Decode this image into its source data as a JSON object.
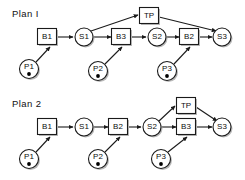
{
  "figure": {
    "type": "process-flow-diagram",
    "width": 245,
    "height": 180,
    "background_color": "#ffffff",
    "stroke_color": "#1a1a1a",
    "shadow_color": "#b9b9b9",
    "token_color": "#000000"
  },
  "plans": [
    {
      "id": "plan-1",
      "label": "Plan  I",
      "nodes": [
        {
          "id": "b1",
          "label": "B1",
          "shape": "square",
          "cx": 47,
          "cy": 37
        },
        {
          "id": "s1",
          "label": "S1",
          "shape": "circle",
          "cx": 84,
          "cy": 37
        },
        {
          "id": "tp",
          "label": "TP",
          "shape": "square",
          "cx": 149,
          "cy": 16
        },
        {
          "id": "b3",
          "label": "B3",
          "shape": "square",
          "cx": 121,
          "cy": 37
        },
        {
          "id": "s2",
          "label": "S2",
          "shape": "circle",
          "cx": 157,
          "cy": 37
        },
        {
          "id": "b2",
          "label": "B2",
          "shape": "square",
          "cx": 189,
          "cy": 37
        },
        {
          "id": "s3",
          "label": "S3",
          "shape": "circle",
          "cx": 222,
          "cy": 37
        },
        {
          "id": "p1",
          "label": "P1",
          "shape": "token-circle",
          "cx": 29,
          "cy": 69
        },
        {
          "id": "p2",
          "label": "P2",
          "shape": "token-circle",
          "cx": 98,
          "cy": 71
        },
        {
          "id": "p3",
          "label": "P3",
          "shape": "token-circle",
          "cx": 167,
          "cy": 71
        }
      ],
      "edges": [
        {
          "from": "b1",
          "to": "s1"
        },
        {
          "from": "s1",
          "to": "tp"
        },
        {
          "from": "s1",
          "to": "b3"
        },
        {
          "from": "tp",
          "to": "s3"
        },
        {
          "from": "b3",
          "to": "s2"
        },
        {
          "from": "s2",
          "to": "b2"
        },
        {
          "from": "b2",
          "to": "s3"
        },
        {
          "from": "p1",
          "to": "b1"
        },
        {
          "from": "p2",
          "to": "b3"
        },
        {
          "from": "p3",
          "to": "b2"
        }
      ]
    },
    {
      "id": "plan-2",
      "label": "Plan 2",
      "nodes": [
        {
          "id": "b1",
          "label": "B1",
          "shape": "square",
          "cx": 47,
          "cy": 127
        },
        {
          "id": "s1",
          "label": "S1",
          "shape": "circle",
          "cx": 84,
          "cy": 127
        },
        {
          "id": "b2",
          "label": "B2",
          "shape": "square",
          "cx": 118,
          "cy": 127
        },
        {
          "id": "s2",
          "label": "S2",
          "shape": "circle",
          "cx": 152,
          "cy": 127
        },
        {
          "id": "tp",
          "label": "TP",
          "shape": "square",
          "cx": 186,
          "cy": 106
        },
        {
          "id": "b3",
          "label": "B3",
          "shape": "square",
          "cx": 186,
          "cy": 127
        },
        {
          "id": "s3",
          "label": "S3",
          "shape": "circle",
          "cx": 222,
          "cy": 127
        },
        {
          "id": "p1",
          "label": "P1",
          "shape": "token-circle",
          "cx": 29,
          "cy": 159
        },
        {
          "id": "p2",
          "label": "P2",
          "shape": "token-circle",
          "cx": 98,
          "cy": 159
        },
        {
          "id": "p3",
          "label": "P3",
          "shape": "token-circle",
          "cx": 161,
          "cy": 159
        }
      ],
      "edges": [
        {
          "from": "b1",
          "to": "s1"
        },
        {
          "from": "s1",
          "to": "b2"
        },
        {
          "from": "b2",
          "to": "s2"
        },
        {
          "from": "s2",
          "to": "tp"
        },
        {
          "from": "s2",
          "to": "b3"
        },
        {
          "from": "tp",
          "to": "s3"
        },
        {
          "from": "b3",
          "to": "s3"
        },
        {
          "from": "p1",
          "to": "b1"
        },
        {
          "from": "p2",
          "to": "b2"
        },
        {
          "from": "p3",
          "to": "b3"
        }
      ]
    }
  ]
}
